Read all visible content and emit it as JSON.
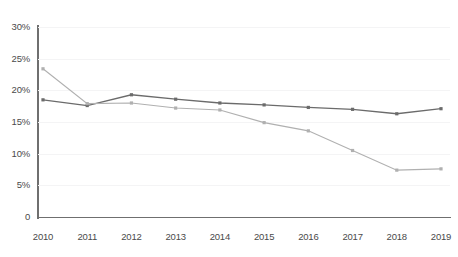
{
  "chart_data": {
    "type": "line",
    "title": "",
    "xlabel": "",
    "ylabel": "",
    "categories": [
      "2010",
      "2011",
      "2012",
      "2013",
      "2014",
      "2015",
      "2016",
      "2017",
      "2018",
      "2019"
    ],
    "ylim": [
      0,
      30
    ],
    "ytick_labels": [
      "30%",
      "25%",
      "20%",
      "15%",
      "10%",
      "5%",
      "0"
    ],
    "ytick_values": [
      30,
      25,
      20,
      15,
      10,
      5,
      0
    ],
    "grid": true,
    "grid_axis": "y",
    "legend_position": "top-right",
    "legend_visible": false,
    "markers": "square",
    "series": [
      {
        "name": "series-1",
        "color": "#6b6b6b",
        "values": [
          18.5,
          17.6,
          19.3,
          18.6,
          18.0,
          17.7,
          17.3,
          17.0,
          16.3,
          17.1
        ]
      },
      {
        "name": "series-2",
        "color": "#b0b0b0",
        "values": [
          23.4,
          17.9,
          18.0,
          17.2,
          16.9,
          14.9,
          13.6,
          10.5,
          7.4,
          7.6
        ]
      }
    ]
  },
  "legend": {
    "cropped": true,
    "items": [
      "",
      "",
      ""
    ]
  },
  "colors": {
    "background": "#ffffff",
    "axis": "#6f6f6f",
    "grid": "#f4f4f5",
    "tick_text": "#4a4a4a",
    "series_1": "#6b6b6b",
    "series_2": "#b0b0b0"
  }
}
